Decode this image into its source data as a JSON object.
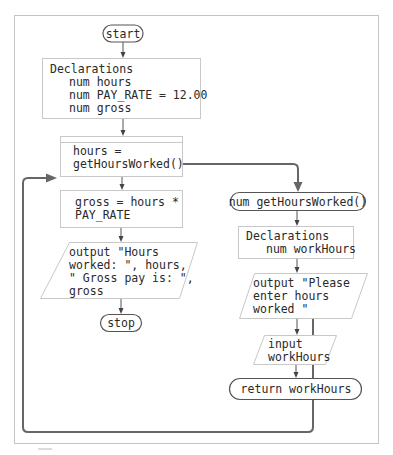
{
  "diagram": {
    "type": "flowchart",
    "main": {
      "start": "start",
      "declarations": {
        "title": "Declarations",
        "lines": [
          "num hours",
          "num PAY_RATE = 12.00",
          "num gross"
        ]
      },
      "call": [
        "hours =",
        "getHoursWorked()"
      ],
      "calc": [
        "gross = hours *",
        "PAY_RATE"
      ],
      "output": [
        "output \"Hours",
        "worked: \", hours,",
        "\" Gross pay is: \",",
        "gross"
      ],
      "stop": "stop"
    },
    "method": {
      "header": "num getHoursWorked()",
      "declarations": {
        "title": "Declarations",
        "lines": [
          "num workHours"
        ]
      },
      "output": [
        "output \"Please",
        "enter hours",
        "worked \""
      ],
      "input": [
        "input",
        "workHours"
      ],
      "return": "return workHours"
    },
    "colors": {
      "text": "#2a2a2a",
      "box_border": "#c8c8c8",
      "terminal_border": "#555555",
      "loop_line": "#666666"
    }
  }
}
